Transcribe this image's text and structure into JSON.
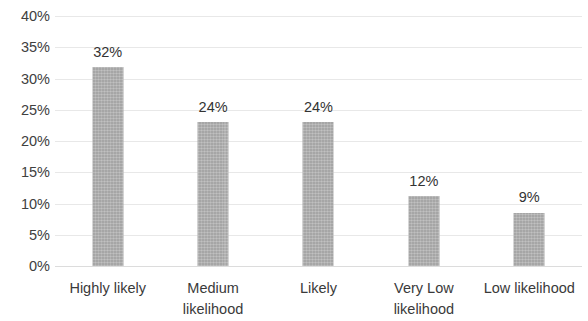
{
  "chart_data": {
    "type": "bar",
    "title": "",
    "subtitle": "",
    "xlabel": "",
    "ylabel": "",
    "categories": [
      "Highly likely",
      "Medium likelihood",
      "Likely",
      "Very Low likelihood",
      "Low likelihood"
    ],
    "category_lines": [
      [
        "Highly likely"
      ],
      [
        "Medium",
        "likelihood"
      ],
      [
        "Likely"
      ],
      [
        "Very Low",
        "likelihood"
      ],
      [
        "Low likelihood"
      ]
    ],
    "values": [
      32,
      24,
      24,
      12,
      9
    ],
    "bar_heights_pct": [
      31.8,
      23.0,
      23.0,
      11.2,
      8.5
    ],
    "data_labels": [
      "32%",
      "24%",
      "24%",
      "12%",
      "9%"
    ],
    "ylim": [
      0,
      40
    ],
    "ytick_values": [
      0,
      5,
      10,
      15,
      20,
      25,
      30,
      35,
      40
    ],
    "ytick_labels": [
      "0%",
      "5%",
      "10%",
      "15%",
      "20%",
      "25%",
      "30%",
      "35%",
      "40%"
    ],
    "grid": true,
    "grid_axis": "y",
    "legend": false,
    "legend_position": "none",
    "colors": {
      "bar_fill": "#a6a6a6",
      "gridline": "#e8e8e8",
      "baseline": "#dcdcdc",
      "tick_text": "#404040",
      "category_text": "#3a3a3a",
      "data_label_text": "#333333",
      "background": "#ffffff"
    }
  }
}
